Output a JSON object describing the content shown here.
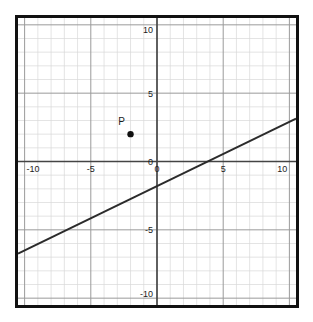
{
  "figure": {
    "background_color": "#ffffff",
    "border_color": "#111111",
    "plot_background_color": "#ffffff"
  },
  "chart_data": {
    "type": "line",
    "title": "",
    "subtitle": "",
    "xlabel": "",
    "ylabel": "",
    "xlim": [
      -10.5,
      10.5
    ],
    "ylim": [
      -10.5,
      10.5
    ],
    "grid": true,
    "grid_minor_step": 1,
    "grid_major_step": 5,
    "grid_minor_color": "#d8d8d8",
    "grid_major_color": "#9a9a9a",
    "axis_color": "#444444",
    "legend": "none",
    "xticks": [
      -10,
      -5,
      0,
      5,
      10
    ],
    "yticks": [
      -10,
      -5,
      0,
      5,
      10
    ],
    "xtick_labels": [
      "-10",
      "-5",
      "0",
      "5",
      "10"
    ],
    "ytick_labels": [
      "-10",
      "-5",
      "0",
      "5",
      "10"
    ],
    "series": [
      {
        "name": "line",
        "type": "line",
        "color": "#2b2b2b",
        "width": 2,
        "slope": 0.47,
        "intercept": -1.8,
        "x": [
          -10.5,
          10.5
        ],
        "y": [
          -6.74,
          3.14
        ]
      }
    ],
    "points": [
      {
        "label": "P",
        "x": -2,
        "y": 2,
        "color": "#111111",
        "radius": 3.2,
        "label_dx": -9,
        "label_dy": -9
      }
    ],
    "annotations": [
      "P"
    ]
  },
  "ticks": {
    "x": [
      {
        "label": "-10",
        "value": -10
      },
      {
        "label": "-5",
        "value": -5
      },
      {
        "label": "0",
        "value": 0
      },
      {
        "label": "5",
        "value": 5
      },
      {
        "label": "10",
        "value": 10
      }
    ],
    "y": [
      {
        "label": "10",
        "value": 10
      },
      {
        "label": "5",
        "value": 5
      },
      {
        "label": "0",
        "value": 0
      },
      {
        "label": "-5",
        "value": -5
      },
      {
        "label": "-10",
        "value": -10
      }
    ]
  }
}
